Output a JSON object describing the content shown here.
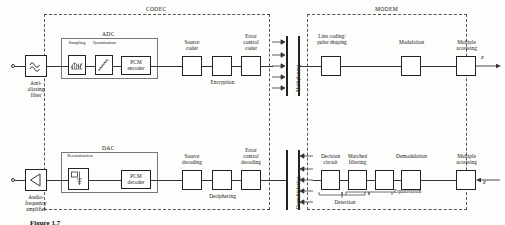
{
  "diagram": {
    "groups": {
      "codec": "CODEC",
      "modem": "MODEM",
      "adc": "ADC",
      "dac": "DAC"
    },
    "transmit_chain": {
      "input_terminal": "input-terminal",
      "anti_aliasing_filter": "Anti-\naliasing\nfilter",
      "sampling": "Sampling",
      "quantization": "Quantization",
      "pcm_encoder": "PCM\nencoder",
      "source_coder": "Source\ncoder",
      "encryption": "Encryption",
      "error_control_coder": "Error\ncontrol\ncoder",
      "multiplexing": "Multiplexing",
      "line_coding": "Line coding/\npulse shaping",
      "modulation": "Modulation",
      "multiple_accessing": "Multiple\naccessing",
      "output_symbol": "z"
    },
    "receive_chain": {
      "output_terminal": "output-terminal",
      "audio_frequency_amplifier": "Audio-\nfrequency\namplifier",
      "reconstruction": "Reconstruction",
      "pcm_decoder": "PCM\ndecoder",
      "source_decoding": "Source\ndecoding",
      "deciphering": "Deciphering",
      "error_control_decoding": "Error\ncontrol\ndecoding",
      "demultiplexing": "Demultiplexing",
      "decision_circuit": "Decision\ncircuit",
      "matched_filtering": "Matched\nfiltering",
      "demodulation": "Demodulation",
      "multiple_accessing": "Multiple\naccessing",
      "equalisation": "Equalisation",
      "detection": "Detection",
      "input_symbol": "z"
    },
    "caption": "Figure 1.7"
  }
}
